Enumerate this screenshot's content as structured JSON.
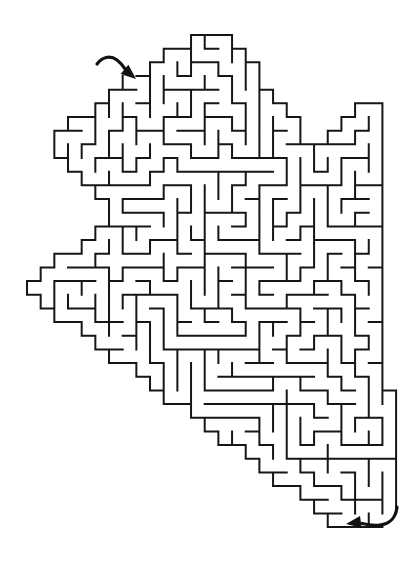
{
  "canvas": {
    "width": 417,
    "height": 567,
    "background": "#ffffff"
  },
  "puzzle": {
    "type": "maze",
    "description": "Black-and-white line maze with an irregular pointed (star-like) outline; curved entrance arrow at the upper left pointing into a gap in the wall, curved exit arrow at the lower right pointing out of a gap at the bottom-right corner."
  },
  "maze": {
    "wall_color": "#161616",
    "wall_thickness": 2,
    "cell_size": 13.67,
    "origin": {
      "x": 27,
      "y": 35
    },
    "grid": {
      "cols": 27,
      "rows": 36
    },
    "outline_polygon": [
      [
        196,
        35
      ],
      [
        228,
        35
      ],
      [
        318,
        152
      ],
      [
        340,
        118
      ],
      [
        353,
        108
      ],
      [
        381,
        108
      ],
      [
        381,
        393
      ],
      [
        396,
        393
      ],
      [
        396,
        527
      ],
      [
        342,
        527
      ],
      [
        27,
        292
      ],
      [
        27,
        283
      ],
      [
        118,
        218
      ],
      [
        46,
        143
      ],
      [
        133,
        78
      ]
    ],
    "seed": 1337421,
    "entrance": {
      "position": "top-left",
      "gap_point": [
        133,
        76
      ],
      "gap_radius": 8
    },
    "exit": {
      "position": "bottom-right",
      "gap_point": [
        394,
        525
      ],
      "gap_radius": 11
    }
  },
  "arrows": {
    "color": "#111111",
    "stroke_width": 3.2,
    "entrance": {
      "tail_path": "M 97 64 C 102 57 110 55 117 60 C 121 63 123.5 66.5 125.5 69.5",
      "head_points": "136,79 120.6,74 128.4,64.8"
    },
    "exit": {
      "tail_path": "M 397 507 C 396 517 390 524 380 525 C 374 525.6 368 525 362 523.5",
      "head_points": "346,524 360,516 361.7,527.8"
    }
  }
}
